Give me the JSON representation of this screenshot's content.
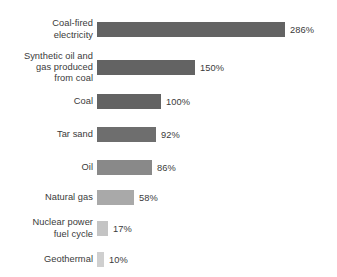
{
  "chart_data": {
    "type": "bar",
    "orientation": "horizontal",
    "title": "",
    "subtitle": "",
    "xlabel": "",
    "ylabel": "",
    "grid": false,
    "legend": null,
    "axis_visible": false,
    "value_suffix": "%",
    "xlim": [
      0,
      286
    ],
    "categories": [
      "Coal-fired\nelectricity",
      "Synthetic oil and\ngas produced\nfrom coal",
      "Coal",
      "Tar sand",
      "Oil",
      "Natural gas",
      "Nuclear power\nfuel cycle",
      "Geothermal"
    ],
    "values": [
      286,
      150,
      100,
      92,
      86,
      58,
      17,
      10
    ],
    "value_labels": [
      "286%",
      "150%",
      "100%",
      "92%",
      "86%",
      "58%",
      "17%",
      "10%"
    ],
    "bar_colors": [
      "#636363",
      "#636363",
      "#636363",
      "#6e6e6e",
      "#898989",
      "#a9a9a9",
      "#c4c4c4",
      "#cfcfcf"
    ],
    "bars": [
      {
        "label": "Coal-fired\nelectricity",
        "value": 286,
        "value_label": "286%",
        "color": "#636363",
        "top": 22,
        "bar_width": 188
      },
      {
        "label": "Synthetic oil and\ngas produced\nfrom coal",
        "value": 150,
        "value_label": "150%",
        "color": "#636363",
        "top": 60,
        "bar_width": 98
      },
      {
        "label": "Coal",
        "value": 100,
        "value_label": "100%",
        "color": "#636363",
        "top": 94,
        "bar_width": 64
      },
      {
        "label": "Tar sand",
        "value": 92,
        "value_label": "92%",
        "color": "#6e6e6e",
        "top": 127,
        "bar_width": 59
      },
      {
        "label": "Oil",
        "value": 86,
        "value_label": "86%",
        "color": "#898989",
        "top": 160,
        "bar_width": 55
      },
      {
        "label": "Natural gas",
        "value": 58,
        "value_label": "58%",
        "color": "#a9a9a9",
        "top": 190,
        "bar_width": 37
      },
      {
        "label": "Nuclear power\nfuel cycle",
        "value": 17,
        "value_label": "17%",
        "color": "#c4c4c4",
        "top": 221,
        "bar_width": 11
      },
      {
        "label": "Geothermal",
        "value": 10,
        "value_label": "10%",
        "color": "#cfcfcf",
        "top": 252,
        "bar_width": 7
      }
    ]
  },
  "colors": {
    "background": "#ffffff",
    "text": "#3a3a3a",
    "bar_dark": "#636363",
    "bar_light": "#cfcfcf"
  }
}
